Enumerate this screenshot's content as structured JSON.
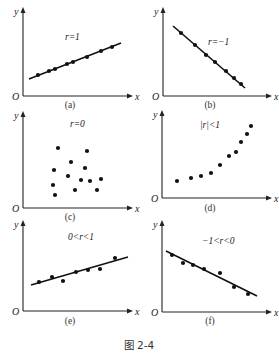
{
  "figure": {
    "caption": "图 2-4",
    "axis_labels": {
      "x": "x",
      "y": "y",
      "origin": "O"
    }
  },
  "chart_data": [
    {
      "type": "scatter",
      "panel": "(a)",
      "annotation": "r=1",
      "fit_line": true,
      "fit": {
        "x1": 6,
        "y1": 17,
        "x2": 98,
        "y2": 53
      },
      "points": [
        [
          15,
          21
        ],
        [
          26,
          25
        ],
        [
          32,
          27
        ],
        [
          44,
          32
        ],
        [
          50,
          34
        ],
        [
          64,
          39
        ],
        [
          78,
          45
        ],
        [
          89,
          49
        ]
      ],
      "axes": {
        "xlabel": "x",
        "ylabel": "y",
        "origin": "O"
      }
    },
    {
      "type": "scatter",
      "panel": "(b)",
      "annotation": "r=−1",
      "fit_line": true,
      "fit": {
        "x1": 10,
        "y1": 70,
        "x2": 82,
        "y2": 8
      },
      "points": [
        [
          18,
          63
        ],
        [
          32,
          51
        ],
        [
          43,
          41
        ],
        [
          52,
          34
        ],
        [
          63,
          25
        ],
        [
          71,
          18
        ],
        [
          78,
          12
        ]
      ],
      "axes": {
        "xlabel": "x",
        "ylabel": "y",
        "origin": "O"
      }
    },
    {
      "type": "scatter",
      "panel": "(c)",
      "annotation": "r=0",
      "fit_line": false,
      "points": [
        [
          35,
          60
        ],
        [
          64,
          57
        ],
        [
          48,
          46
        ],
        [
          62,
          40
        ],
        [
          31,
          38
        ],
        [
          45,
          32
        ],
        [
          58,
          28
        ],
        [
          67,
          27
        ],
        [
          78,
          29
        ],
        [
          30,
          23
        ],
        [
          52,
          18
        ],
        [
          74,
          18
        ],
        [
          32,
          13
        ]
      ],
      "axes": {
        "xlabel": "x",
        "ylabel": "y",
        "origin": "O"
      }
    },
    {
      "type": "scatter",
      "panel": "(d)",
      "annotation": "|r|<1",
      "fit_line": false,
      "points": [
        [
          15,
          17
        ],
        [
          29,
          20
        ],
        [
          39,
          22
        ],
        [
          49,
          25
        ],
        [
          58,
          33
        ],
        [
          67,
          42
        ],
        [
          74,
          46
        ],
        [
          79,
          56
        ],
        [
          85,
          64
        ],
        [
          89,
          72
        ]
      ],
      "axes": {
        "xlabel": "x",
        "ylabel": "y",
        "origin": "O"
      }
    },
    {
      "type": "scatter",
      "panel": "(e)",
      "annotation": "0<r<1",
      "fit_line": true,
      "fit": {
        "x1": 8,
        "y1": 26,
        "x2": 105,
        "y2": 54
      },
      "points": [
        [
          16,
          29
        ],
        [
          29,
          34
        ],
        [
          40,
          30
        ],
        [
          53,
          39
        ],
        [
          65,
          41
        ],
        [
          77,
          42
        ],
        [
          92,
          53
        ]
      ],
      "axes": {
        "xlabel": "x",
        "ylabel": "y",
        "origin": "O"
      }
    },
    {
      "type": "scatter",
      "panel": "(f)",
      "annotation": "−1<r<0",
      "fit_line": true,
      "fit": {
        "x1": 4,
        "y1": 61,
        "x2": 95,
        "y2": 16
      },
      "points": [
        [
          10,
          57
        ],
        [
          21,
          49
        ],
        [
          31,
          47
        ],
        [
          42,
          43
        ],
        [
          58,
          39
        ],
        [
          72,
          25
        ],
        [
          86,
          18
        ]
      ],
      "axes": {
        "xlabel": "x",
        "ylabel": "y",
        "origin": "O"
      }
    }
  ]
}
